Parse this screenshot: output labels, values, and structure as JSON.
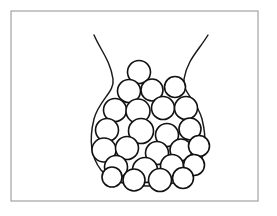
{
  "figure": {
    "caption": "",
    "canvas": {
      "width": 277,
      "height": 216,
      "background": "#ffffff"
    },
    "frame": {
      "label": "image border",
      "x": 11,
      "y": 11,
      "width": 247,
      "height": 190,
      "stroke_color": "#9a9a9a",
      "stroke_width": 1.1
    },
    "vessel": {
      "label": "vase",
      "stroke_color": "#1a1a1a",
      "fill_color": "#ffffff",
      "stroke_width": 1.45,
      "left_rim_x": 94,
      "right_rim_x": 208,
      "rim_y": 35,
      "neck_left_x": 113,
      "neck_right_x": 189,
      "neck_y": 79,
      "body_left_x": 92,
      "body_right_x": 204,
      "body_mid_y": 140,
      "bottom_y": 185,
      "path": "M 94 35 C 101 51, 110 60, 113 79 C 115 92, 99 100, 94 119 C 89 139, 90 156, 101 170 C 112 183, 130 186, 148 186 C 167 186, 186 182, 196 169 C 206 156, 207 139, 202 119 C 197 100, 182 93, 184 79 C 187 60, 199 50, 208 35"
    },
    "circles": {
      "label": "packed circles",
      "count": 25,
      "stroke_color": "#111111",
      "fill_color": "#ffffff",
      "stroke_width": 1.6,
      "items": [
        {
          "cx": 139,
          "cy": 72,
          "r": 11.5
        },
        {
          "cx": 129,
          "cy": 91,
          "r": 11.5
        },
        {
          "cx": 152,
          "cy": 90,
          "r": 11.0
        },
        {
          "cx": 175,
          "cy": 87,
          "r": 10.5
        },
        {
          "cx": 115,
          "cy": 110,
          "r": 11.5
        },
        {
          "cx": 138,
          "cy": 111,
          "r": 12.0
        },
        {
          "cx": 163,
          "cy": 108,
          "r": 11.5
        },
        {
          "cx": 186,
          "cy": 108,
          "r": 11.5
        },
        {
          "cx": 107,
          "cy": 130,
          "r": 11.5
        },
        {
          "cx": 141,
          "cy": 131,
          "r": 12.5
        },
        {
          "cx": 167,
          "cy": 135,
          "r": 11.5
        },
        {
          "cx": 190,
          "cy": 129,
          "r": 11.0
        },
        {
          "cx": 104,
          "cy": 150,
          "r": 12.0
        },
        {
          "cx": 127,
          "cy": 148,
          "r": 11.5
        },
        {
          "cx": 157,
          "cy": 153,
          "r": 11.5
        },
        {
          "cx": 181,
          "cy": 150,
          "r": 11.0
        },
        {
          "cx": 199,
          "cy": 146,
          "r": 10.5
        },
        {
          "cx": 116,
          "cy": 167,
          "r": 11.5
        },
        {
          "cx": 145,
          "cy": 170,
          "r": 12.5
        },
        {
          "cx": 172,
          "cy": 166,
          "r": 11.5
        },
        {
          "cx": 194,
          "cy": 165,
          "r": 10.5
        },
        {
          "cx": 134,
          "cy": 180,
          "r": 11.0
        },
        {
          "cx": 160,
          "cy": 180,
          "r": 11.5
        },
        {
          "cx": 183,
          "cy": 178,
          "r": 10.5
        },
        {
          "cx": 112,
          "cy": 177,
          "r": 10.0
        }
      ]
    }
  }
}
